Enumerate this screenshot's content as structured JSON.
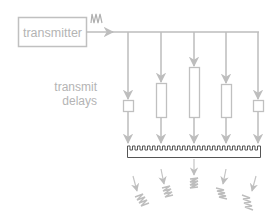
{
  "diagram": {
    "transmitter_label": "transmitter",
    "delays_label_line1": "transmit",
    "delays_label_line2": "delays",
    "colors": {
      "line": "#bdbdbd",
      "box": "#c0c0c0",
      "text": "#b4b4b4",
      "array": "#555555"
    },
    "channels": [
      {
        "x": 128,
        "delay": "short"
      },
      {
        "x": 161,
        "delay": "medium"
      },
      {
        "x": 194,
        "delay": "long"
      },
      {
        "x": 226,
        "delay": "medium"
      },
      {
        "x": 258,
        "delay": "short"
      }
    ]
  }
}
